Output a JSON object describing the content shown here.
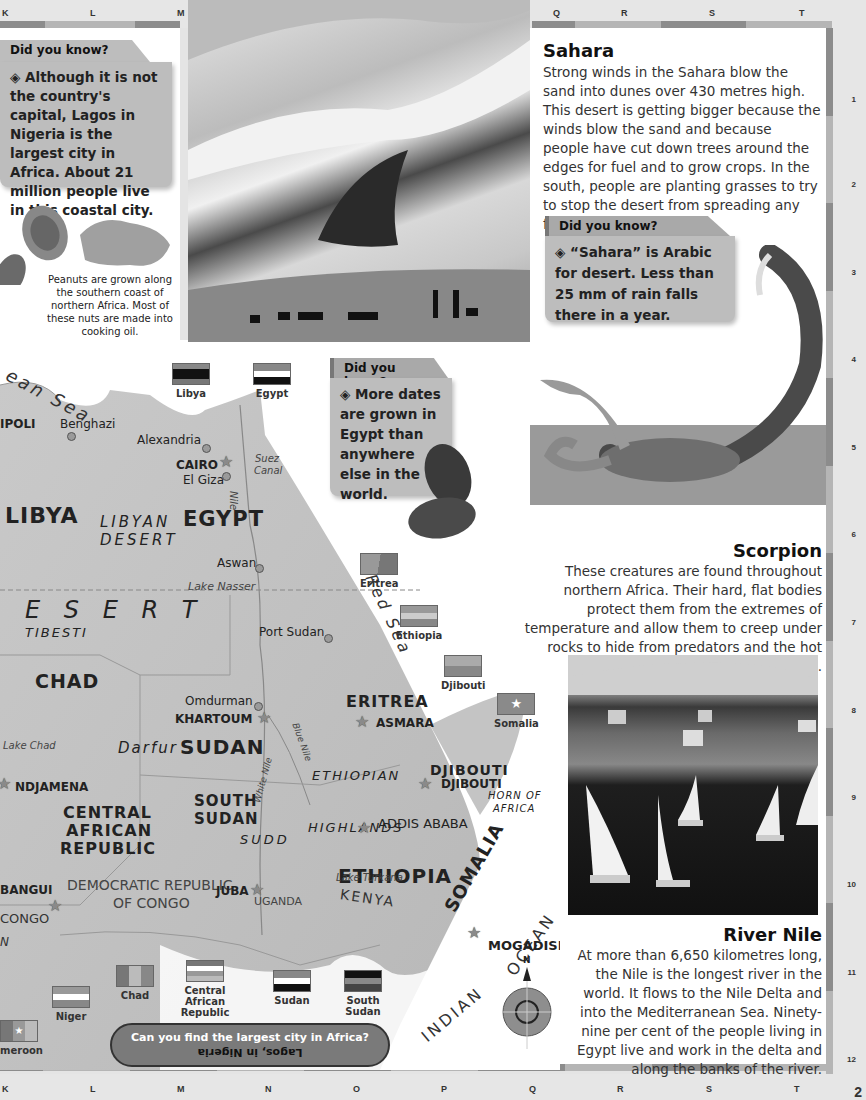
{
  "grid": {
    "top_letters": [
      "K",
      "L",
      "M",
      "Q",
      "R",
      "S",
      "T"
    ],
    "bottom_letters": [
      "K",
      "L",
      "M",
      "N",
      "O",
      "P",
      "Q",
      "R",
      "S",
      "T"
    ],
    "row_numbers": [
      "1",
      "2",
      "3",
      "4",
      "5",
      "6",
      "7",
      "8",
      "9",
      "10",
      "11",
      "12"
    ],
    "page_number": "2"
  },
  "dyk_lagos": {
    "heading": "Did you know?",
    "bullet": "◈",
    "text": "Although it is not the country's capital, Lagos in Nigeria is the largest city in Africa. About 21 million people live in this coastal city."
  },
  "peanuts": {
    "caption": "Peanuts are grown along the southern coast of northern Africa. Most of these nuts are made into cooking oil."
  },
  "sahara": {
    "title": "Sahara",
    "text": "Strong winds in the Sahara blow the sand into dunes over 430 metres high. This desert is getting bigger because the winds blow the sand and because people have cut down trees around the edges for fuel and to grow crops. In the south, people are planting grasses to try to stop the desert from spreading any further."
  },
  "dyk_sahara": {
    "heading": "Did you know?",
    "bullet": "◈",
    "text": "“Sahara” is Arabic for desert. Less than 25 mm of rain falls there in a year."
  },
  "dyk_dates": {
    "heading": "Did you know?",
    "bullet": "◈",
    "text": "More dates are grown in Egypt than anywhere else in the world."
  },
  "scorpion": {
    "title": "Scorpion",
    "text": "These creatures are found throughout northern Africa. Their hard, flat bodies protect them from the extremes of temperature and allow them to creep under rocks to hide from predators and the hot desert sun."
  },
  "river_nile": {
    "title": "River Nile",
    "text": "At more than 6,650 kilometres long, the Nile is the longest river in the world. It flows to the Nile Delta and into the Mediterranean Sea. Ninety-nine per cent of the people living in Egypt live and work in the delta and along the banks of the river."
  },
  "quiz": {
    "question": "Can you find the largest city in Africa?",
    "answer": "Lagos, in Nigeria"
  },
  "map": {
    "sea_label": "ean  Sea",
    "red_sea": "Red Sea",
    "indian": "INDIAN",
    "ocean": "OCEAN",
    "countries": {
      "libya": "LIBYA",
      "egypt": "EGYPT",
      "chad": "CHAD",
      "sudan": "SUDAN",
      "south_sudan_1": "SOUTH",
      "south_sudan_2": "SUDAN",
      "car_1": "CENTRAL",
      "car_2": "AFRICAN",
      "car_3": "REPUBLIC",
      "eritrea": "ERITREA",
      "djibouti": "DJIBOUTI",
      "ethiopia": "ETHIOPIA",
      "somalia": "SOMALIA",
      "drc_1": "DEMOCRATIC REPUBLIC",
      "drc_2": "OF CONGO",
      "uganda": "UGANDA",
      "kenya": "KENYA",
      "congo": "CONGO",
      "cameroon_partial": "N"
    },
    "regions": {
      "libyan_desert_1": "LIBYAN",
      "libyan_desert_2": "DESERT",
      "desert": "E  S  E  R  T",
      "tibesti": "TIBESTI",
      "darfur": "Darfur",
      "ethiopian": "ETHIOPIAN",
      "highlands": "HIGHLANDS",
      "sudd": "SUDD",
      "horn_1": "HORN OF",
      "horn_2": "AFRICA"
    },
    "cities": {
      "tripoli": "IPOLI",
      "benghazi": "Benghazi",
      "alexandria": "Alexandria",
      "cairo": "CAIRO",
      "el_giza": "El Giza",
      "aswan": "Aswan",
      "port_sudan": "Port Sudan",
      "omdurman": "Omdurman",
      "khartoum": "KHARTOUM",
      "ndjamena": "NDJAMENA",
      "asmara": "ASMARA",
      "djibouti_city": "DJIBOUTI",
      "addis_ababa": "ADDIS ABABA",
      "juba": "JUBA",
      "bangui": "BANGUI",
      "mogadishu": "MOGADISHU"
    },
    "water": {
      "suez_1": "Suez",
      "suez_2": "Canal",
      "nile": "Nile",
      "lake_nasser": "Lake Nasser",
      "lake_chad": "Lake Chad",
      "blue_nile": "Blue Nile",
      "white_nile": "White Nile",
      "lake_turkana": "Lake Turkana"
    },
    "compass_n": "N"
  },
  "flags": [
    {
      "name": "Libya"
    },
    {
      "name": "Egypt"
    },
    {
      "name": "Eritrea"
    },
    {
      "name": "Ethiopia"
    },
    {
      "name": "Djibouti"
    },
    {
      "name": "Somalia"
    },
    {
      "name": "Niger"
    },
    {
      "name": "Chad"
    },
    {
      "name": "Central African Republic"
    },
    {
      "name": "Sudan"
    },
    {
      "name": "South Sudan"
    },
    {
      "name": "meroon"
    }
  ],
  "colors": {
    "frame": "#e6e6e6",
    "bar_dark": "#8c8c8c",
    "bar_light": "#b5b5b5",
    "dyk_tab": "#a9a9a9",
    "dyk_body": "#bdbdbd",
    "quiz_pill": "#7a7a7a"
  }
}
